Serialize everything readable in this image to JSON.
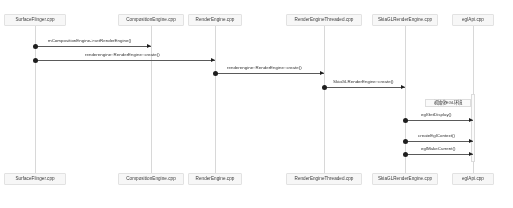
{
  "diagram": {
    "type": "uml-sequence-diagram",
    "width": 513,
    "height": 208,
    "background_color": "#ffffff",
    "line_color": "#5a5a5a",
    "box_fill_color": "#f7f7f7",
    "box_border_color": "#e2e2e2",
    "lifeline_color": "#d8d8d8"
  },
  "participants": [
    {
      "id": "surfaceflinger",
      "label": "SurfaceFlinger.cpp",
      "x": 35,
      "box_width": 62
    },
    {
      "id": "compositionengine",
      "label": "CompositionEngine.cpp",
      "x": 151,
      "box_width": 66
    },
    {
      "id": "renderengine",
      "label": "RenderEngine.cpp",
      "x": 215,
      "box_width": 54
    },
    {
      "id": "renderenginethreaded",
      "label": "RenderEngineThreaded.cpp",
      "x": 324,
      "box_width": 76
    },
    {
      "id": "skiaglrenderengine",
      "label": "SkiaGLRenderEngine.cpp",
      "x": 405,
      "box_width": 66
    },
    {
      "id": "eglapi",
      "label": "eglApi.cpp",
      "x": 473,
      "box_width": 42
    }
  ],
  "messages": [
    {
      "id": "m1",
      "label": "mCompositionEngine->setRenderEngine()",
      "from": "surfaceflinger",
      "to": "compositionengine",
      "y": 46,
      "label_x": 48,
      "label_y": 39
    },
    {
      "id": "m2",
      "label": "renderengine::RenderEngine::create()",
      "from": "surfaceflinger",
      "to": "renderengine",
      "y": 60,
      "label_x": 85,
      "label_y": 53
    },
    {
      "id": "m3",
      "label": "renderengine::RenderEngine::create()",
      "from": "renderengine",
      "to": "renderenginethreaded",
      "y": 73,
      "label_x": 227,
      "label_y": 66
    },
    {
      "id": "m4",
      "label": "SkiaGLRenderEngine::create()",
      "from": "renderenginethreaded",
      "to": "skiaglrenderengine",
      "y": 87,
      "label_x": 333,
      "label_y": 80
    },
    {
      "id": "m5",
      "label": "eglGetDisplay()",
      "from": "skiaglrenderengine",
      "to": "eglapi",
      "y": 120,
      "label_x": 421,
      "label_y": 113
    },
    {
      "id": "m6",
      "label": "createEglContext()",
      "from": "skiaglrenderengine",
      "to": "eglapi",
      "y": 141,
      "label_x": 418,
      "label_y": 134
    },
    {
      "id": "m7",
      "label": "eglMakeCurrent()",
      "from": "skiaglrenderengine",
      "to": "eglapi",
      "y": 154,
      "label_x": 421,
      "label_y": 147
    }
  ],
  "notes": [
    {
      "id": "note-egl-init",
      "text": "初始化EGL环境",
      "x": 425,
      "y": 99,
      "width": 46,
      "height": 8
    }
  ],
  "activations": [
    {
      "id": "act-eglapi",
      "participant": "eglapi",
      "x": 471,
      "y": 94,
      "height": 68
    }
  ],
  "footer_participants": [
    {
      "id": "surfaceflinger-footer",
      "label": "SurfaceFlinger.cpp",
      "x": 35,
      "box_width": 62
    },
    {
      "id": "compositionengine-footer",
      "label": "CompositionEngine.cpp",
      "x": 151,
      "box_width": 66
    },
    {
      "id": "renderengine-footer",
      "label": "RenderEngine.cpp",
      "x": 215,
      "box_width": 54
    },
    {
      "id": "renderenginethreaded-footer",
      "label": "RenderEngineThreaded.cpp",
      "x": 324,
      "box_width": 76
    },
    {
      "id": "skiaglrenderengine-footer",
      "label": "SkiaGLRenderEngine.cpp",
      "x": 405,
      "box_width": 66
    },
    {
      "id": "eglapi-footer",
      "label": "eglApi.cpp",
      "x": 473,
      "box_width": 42
    }
  ]
}
